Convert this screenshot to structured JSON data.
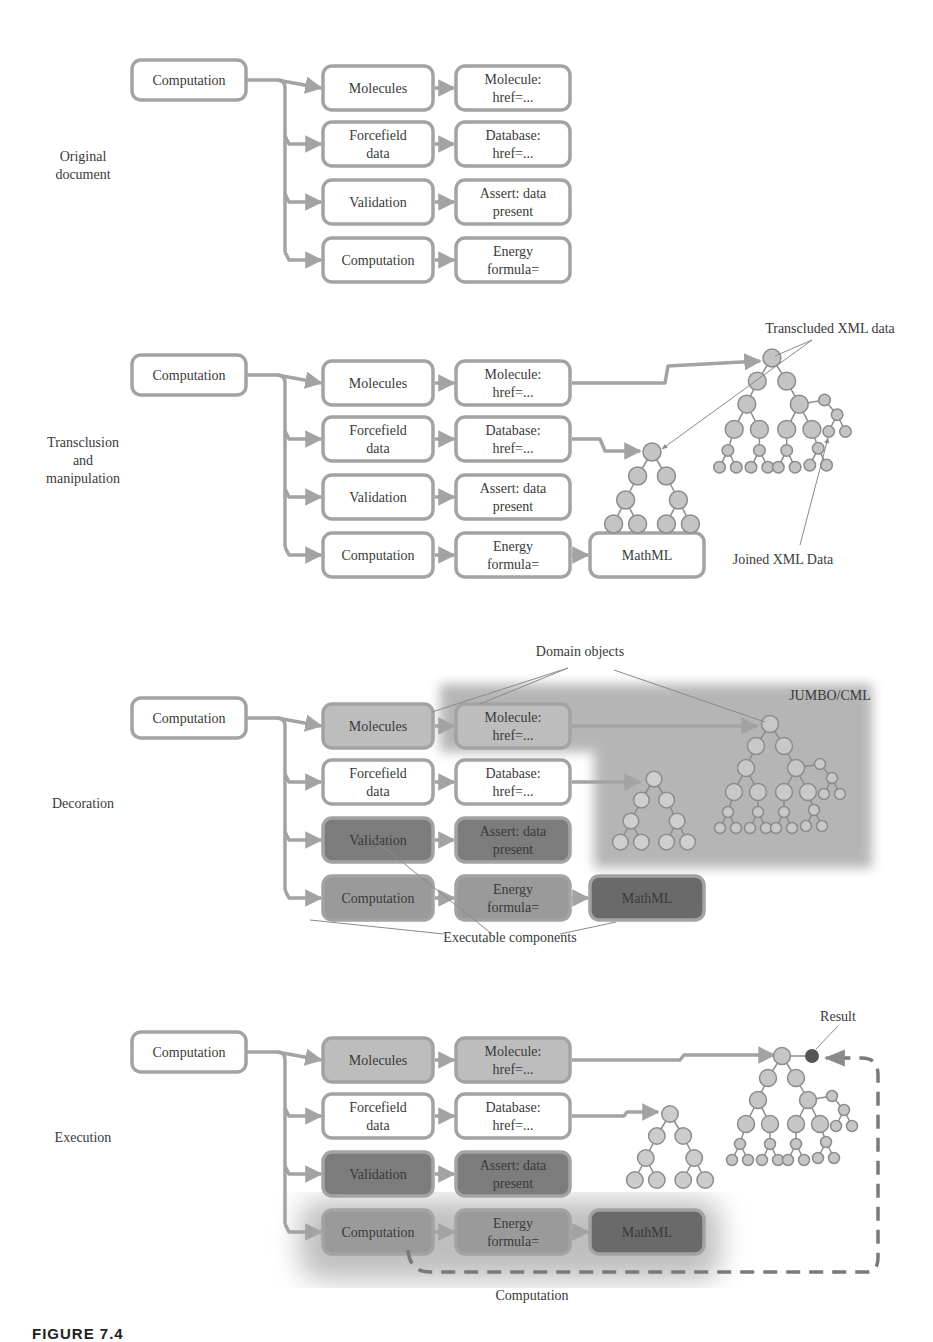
{
  "colors": {
    "stroke": "#a3a3a3",
    "text": "#3a3a3a",
    "white": "#ffffff",
    "light": "#bdbdbd",
    "medium": "#9a9a9a",
    "dark": "#7c7c7c",
    "darker": "#6a6a6a",
    "node": "#c4c4c4",
    "panel": "#a9a9a9",
    "result": "#555555"
  },
  "panels": [
    {
      "label": [
        "Original",
        "document"
      ],
      "y": 60,
      "root": {
        "label": "Computation",
        "style": "white"
      },
      "rows": [
        {
          "a": {
            "label": [
              "Molecules"
            ],
            "style": "white"
          },
          "b": {
            "label": [
              "Molecule:",
              "href=..."
            ],
            "style": "white"
          }
        },
        {
          "a": {
            "label": [
              "Forcefield",
              "data"
            ],
            "style": "white"
          },
          "b": {
            "label": [
              "Database:",
              "href=..."
            ],
            "style": "white"
          }
        },
        {
          "a": {
            "label": [
              "Validation"
            ],
            "style": "white"
          },
          "b": {
            "label": [
              "Assert: data",
              "present"
            ],
            "style": "white"
          }
        },
        {
          "a": {
            "label": [
              "Computation"
            ],
            "style": "white"
          },
          "b": {
            "label": [
              "Energy",
              "formula="
            ],
            "style": "white"
          }
        }
      ]
    },
    {
      "label": [
        "Transclusion",
        "and",
        "manipulation"
      ],
      "y": 355,
      "root": {
        "label": "Computation",
        "style": "white"
      },
      "rows": [
        {
          "a": {
            "label": [
              "Molecules"
            ],
            "style": "white"
          },
          "b": {
            "label": [
              "Molecule:",
              "href=..."
            ],
            "style": "white"
          }
        },
        {
          "a": {
            "label": [
              "Forcefield",
              "data"
            ],
            "style": "white"
          },
          "b": {
            "label": [
              "Database:",
              "href=..."
            ],
            "style": "white"
          }
        },
        {
          "a": {
            "label": [
              "Validation"
            ],
            "style": "white"
          },
          "b": {
            "label": [
              "Assert: data",
              "present"
            ],
            "style": "white"
          }
        },
        {
          "a": {
            "label": [
              "Computation"
            ],
            "style": "white"
          },
          "b": {
            "label": [
              "Energy",
              "formula="
            ],
            "style": "white"
          },
          "c": {
            "label": [
              "MathML"
            ],
            "style": "white"
          }
        }
      ],
      "annotations": [
        {
          "text": "Transcluded XML data",
          "x": 830,
          "y": 333
        },
        {
          "text": "Joined XML Data",
          "x": 783,
          "y": 564
        }
      ]
    },
    {
      "label": [
        "Decoration"
      ],
      "y": 698,
      "root": {
        "label": "Computation",
        "style": "white"
      },
      "rows": [
        {
          "a": {
            "label": [
              "Molecules"
            ],
            "style": "light"
          },
          "b": {
            "label": [
              "Molecule:",
              "href=..."
            ],
            "style": "light"
          }
        },
        {
          "a": {
            "label": [
              "Forcefield",
              "data"
            ],
            "style": "white"
          },
          "b": {
            "label": [
              "Database:",
              "href=..."
            ],
            "style": "white"
          }
        },
        {
          "a": {
            "label": [
              "Validation"
            ],
            "style": "dark"
          },
          "b": {
            "label": [
              "Assert: data",
              "present"
            ],
            "style": "dark"
          }
        },
        {
          "a": {
            "label": [
              "Computation"
            ],
            "style": "medium"
          },
          "b": {
            "label": [
              "Energy",
              "formula="
            ],
            "style": "medium"
          },
          "c": {
            "label": [
              "MathML"
            ],
            "style": "darker"
          }
        }
      ],
      "annotations": [
        {
          "text": "Domain objects",
          "x": 580,
          "y": 656
        },
        {
          "text": "JUMBO/CML",
          "x": 830,
          "y": 700
        },
        {
          "text": "Executable components",
          "x": 510,
          "y": 942
        }
      ]
    },
    {
      "label": [
        "Execution"
      ],
      "y": 1032,
      "root": {
        "label": "Computation",
        "style": "white"
      },
      "rows": [
        {
          "a": {
            "label": [
              "Molecules"
            ],
            "style": "light"
          },
          "b": {
            "label": [
              "Molecule:",
              "href=..."
            ],
            "style": "light"
          }
        },
        {
          "a": {
            "label": [
              "Forcefield",
              "data"
            ],
            "style": "white"
          },
          "b": {
            "label": [
              "Database:",
              "href=..."
            ],
            "style": "white"
          }
        },
        {
          "a": {
            "label": [
              "Validation"
            ],
            "style": "dark"
          },
          "b": {
            "label": [
              "Assert: data",
              "present"
            ],
            "style": "dark"
          }
        },
        {
          "a": {
            "label": [
              "Computation"
            ],
            "style": "medium"
          },
          "b": {
            "label": [
              "Energy",
              "formula="
            ],
            "style": "medium"
          },
          "c": {
            "label": [
              "MathML"
            ],
            "style": "darker"
          }
        }
      ],
      "annotations": [
        {
          "text": "Result",
          "x": 838,
          "y": 1021
        },
        {
          "text": "Computation",
          "x": 532,
          "y": 1300
        }
      ]
    }
  ],
  "caption": "FIGURE 7.4"
}
